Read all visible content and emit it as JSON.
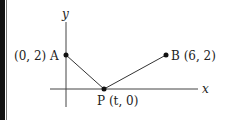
{
  "diagram": {
    "axes": {
      "x_label": "x",
      "y_label": "y"
    },
    "points": {
      "A": {
        "name": "A",
        "coord_label": "(0, 2)",
        "full_label": "(0, 2) A"
      },
      "B": {
        "name": "B",
        "coord_label": "(6, 2)",
        "full_label": "B (6, 2)"
      },
      "P": {
        "name": "P",
        "coord_label": "(t, 0)",
        "full_label": "P (t, 0)"
      }
    },
    "segments": [
      "A-P",
      "P-B"
    ],
    "colors": {
      "line": "#333333",
      "border": "#111111"
    }
  }
}
